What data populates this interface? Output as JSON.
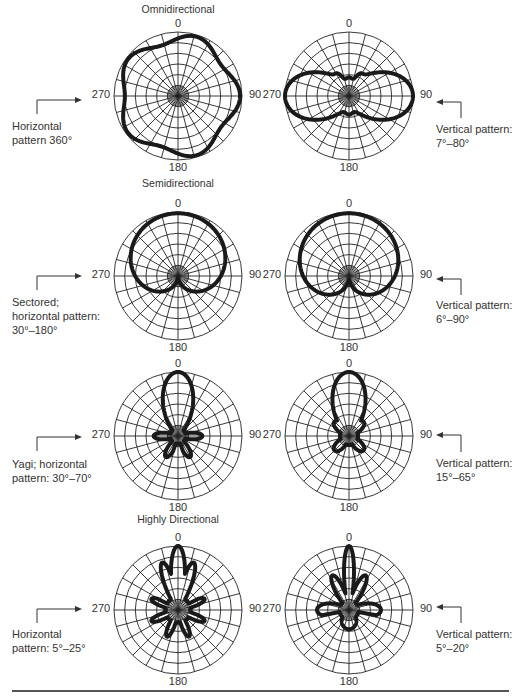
{
  "sections": {
    "omni": "Omnidirectional",
    "semi": "Semidirectional",
    "highly": "Highly Directional"
  },
  "angle_labels": {
    "top": "0",
    "right": "90",
    "bottom": "180",
    "left": "270"
  },
  "captions": {
    "r1_left": "Horizontal\npattern 360°",
    "r1_right": "Vertical pattern:\n7°–80°",
    "r2_left": "Sectored;\nhorizontal pattern:\n30°–180°",
    "r2_right": "Vertical pattern:\n6°–90°",
    "r3_left": "Yagi; horizontal\npattern: 30°–70°",
    "r3_right": "Vertical pattern:\n15°–65°",
    "r4_left": "Horizontal\npattern: 5°–25°",
    "r4_right": "Vertical pattern:\n5°–20°"
  },
  "plots": [
    {
      "id": "omni-horizontal",
      "row": 1,
      "side": "left",
      "cx": 178,
      "cy": 96,
      "pattern": "omni_h"
    },
    {
      "id": "omni-vertical",
      "row": 1,
      "side": "right",
      "cx": 349,
      "cy": 96,
      "pattern": "omni_v"
    },
    {
      "id": "semi-horizontal",
      "row": 2,
      "side": "left",
      "cx": 178,
      "cy": 276,
      "pattern": "semi_h"
    },
    {
      "id": "semi-vertical",
      "row": 2,
      "side": "right",
      "cx": 349,
      "cy": 276,
      "pattern": "semi_v"
    },
    {
      "id": "yagi-horizontal",
      "row": 3,
      "side": "left",
      "cx": 178,
      "cy": 436,
      "pattern": "yagi_h"
    },
    {
      "id": "yagi-vertical",
      "row": 3,
      "side": "right",
      "cx": 349,
      "cy": 436,
      "pattern": "yagi_v"
    },
    {
      "id": "highly-horizontal",
      "row": 4,
      "side": "left",
      "cx": 178,
      "cy": 610,
      "pattern": "high_h"
    },
    {
      "id": "highly-vertical",
      "row": 4,
      "side": "right",
      "cx": 349,
      "cy": 610,
      "pattern": "high_v"
    }
  ],
  "grid": {
    "radius": 64,
    "rings": 6,
    "spokes": 24
  },
  "colors": {
    "grid": "#222222",
    "pattern": "#1a1a1a",
    "text": "#333333"
  }
}
